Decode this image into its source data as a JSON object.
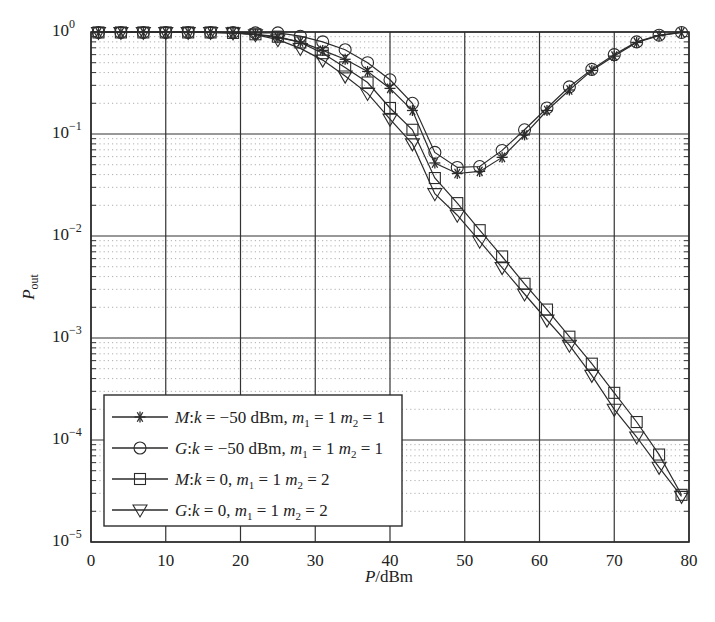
{
  "chart_data": {
    "type": "line",
    "title": "",
    "xlabel": "P/dBm",
    "ylabel": "P_out",
    "xlim": [
      0,
      80
    ],
    "ylim": [
      1e-05,
      1
    ],
    "yscale": "log",
    "grid": {
      "major": true,
      "minor": true,
      "minor_style": "dotted"
    },
    "legend_position": "lower left",
    "xticks": [
      0,
      10,
      20,
      30,
      40,
      50,
      60,
      70,
      80
    ],
    "yticks": [
      {
        "value": 1,
        "exp": "0"
      },
      {
        "value": 0.1,
        "exp": "-1"
      },
      {
        "value": 0.01,
        "exp": "-2"
      },
      {
        "value": 0.001,
        "exp": "-3"
      },
      {
        "value": 0.0001,
        "exp": "-4"
      },
      {
        "value": 1e-05,
        "exp": "-5"
      }
    ],
    "x": [
      1,
      4,
      7,
      10,
      13,
      16,
      19,
      22,
      25,
      28,
      31,
      34,
      37,
      40,
      43,
      46,
      49,
      52,
      55,
      58,
      61,
      64,
      67,
      70,
      73,
      76,
      79
    ],
    "series": [
      {
        "name": "M:k = −50 dBm, m1 = 1 m2 = 1",
        "marker": "star",
        "legend": {
          "prefix": "M",
          "k": "−50 dBm",
          "m1": "1",
          "m2": "1"
        },
        "values": [
          0.99,
          0.99,
          0.99,
          0.99,
          0.99,
          0.99,
          0.98,
          0.95,
          0.88,
          0.8,
          0.66,
          0.54,
          0.41,
          0.28,
          0.17,
          0.052,
          0.041,
          0.043,
          0.059,
          0.098,
          0.17,
          0.27,
          0.42,
          0.58,
          0.79,
          0.92,
          0.99
        ]
      },
      {
        "name": "G:k = −50 dBm, m1 = 1 m2 = 1",
        "marker": "circle",
        "legend": {
          "prefix": "G",
          "k": "−50 dBm",
          "m1": "1",
          "m2": "1"
        },
        "values": [
          0.99,
          0.99,
          0.99,
          0.99,
          0.99,
          0.99,
          0.99,
          0.98,
          0.98,
          0.91,
          0.8,
          0.67,
          0.5,
          0.34,
          0.2,
          0.066,
          0.047,
          0.048,
          0.069,
          0.11,
          0.18,
          0.29,
          0.43,
          0.6,
          0.8,
          0.93,
          0.99
        ]
      },
      {
        "name": "M:k = 0, m1 = 1 m2 = 2",
        "marker": "square",
        "legend": {
          "prefix": "M",
          "k": "0",
          "m1": "1",
          "m2": "2"
        },
        "values": [
          0.99,
          0.99,
          0.99,
          0.99,
          0.99,
          0.99,
          0.98,
          0.95,
          0.9,
          0.79,
          0.62,
          0.45,
          0.32,
          0.18,
          0.11,
          0.037,
          0.021,
          0.0114,
          0.0063,
          0.0034,
          0.0019,
          0.00103,
          0.00056,
          0.00029,
          0.00015,
          7.2e-05,
          2.9e-05
        ]
      },
      {
        "name": "G:k = 0, m1 = 1 m2 = 2",
        "marker": "triangle-down",
        "legend": {
          "prefix": "G",
          "k": "0",
          "m1": "1",
          "m2": "2"
        },
        "values": [
          0.99,
          0.99,
          0.99,
          0.99,
          0.99,
          0.99,
          0.98,
          0.94,
          0.84,
          0.69,
          0.53,
          0.37,
          0.25,
          0.14,
          0.08,
          0.026,
          0.016,
          0.0089,
          0.0049,
          0.0027,
          0.0015,
          0.00085,
          0.00043,
          0.0002,
          0.000107,
          5.4e-05,
          2.8e-05
        ]
      }
    ]
  },
  "colors": {
    "line": "#2b2b2b",
    "grid_major": "#333333",
    "grid_minor": "#9a9a9a",
    "background": "#ffffff"
  }
}
